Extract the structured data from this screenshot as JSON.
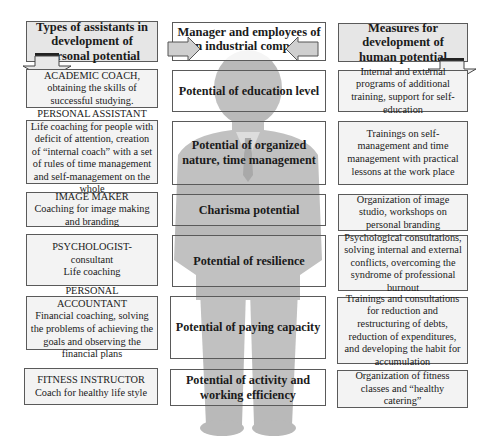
{
  "headers": {
    "left": "Types of assistants in development of personal potential",
    "center": "Manager and employees of an industrial company",
    "right": "Measures for development of human potential"
  },
  "assistants": [
    {
      "title": "ACADEMIC COACH, obtaining the skills of successful studying.",
      "desc": ""
    },
    {
      "title": "PERSONAL ASSISTANT",
      "desc": "Life coaching for people with deficit of attention, creation of “internal coach” with a set of rules of time management and self-management on the whole"
    },
    {
      "title": "IMAGE MAKER",
      "desc": "Coaching for image making and branding"
    },
    {
      "title": "PSYCHOLOGIST- consultant",
      "desc": "Life coaching"
    },
    {
      "title": "PERSONAL ACCOUNTANT",
      "desc": "Financial coaching, solving the problems of achieving the goals and observing the financial plans"
    },
    {
      "title": "FITNESS INSTRUCTOR",
      "desc": "Coach for healthy life style"
    }
  ],
  "potentials": [
    "Potential of education level",
    "Potential of organized nature, time management",
    "Charisma potential",
    "Potential of resilience",
    "Potential of paying capacity",
    "Potential of activity and working efficiency"
  ],
  "measures": [
    "Internal and external programs of additional training, support for self-education",
    "Trainings on self-management and time management with practical lessons at the work place",
    "Organization of image studio, workshops on personal branding",
    "Psychological consultations, solving internal and external conflicts, overcoming the syndrome of professional burnout",
    "Trainings and consultations for reduction and restructuring of debts, reduction of expenditures, and developing the habit for accumulation",
    "Organization of fitness classes and “healthy catering”"
  ],
  "colors": {
    "header_fill": "#e6e6e6",
    "side_fill": "#f3f3f3",
    "silhouette": "#b8b8b8",
    "arrow_fill": "#cfcfcf",
    "border": "#5a5a5a"
  }
}
